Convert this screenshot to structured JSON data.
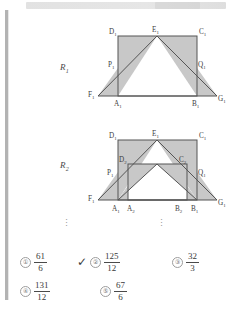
{
  "page": {
    "background": "#ffffff",
    "fill_color": "#c8c8c8",
    "stroke_color": "#555555"
  },
  "header_strip": {
    "present": true,
    "label": ""
  },
  "figures": [
    {
      "name": "R1",
      "label": "R",
      "label_sub": "1",
      "vertices": [
        "D₁",
        "E₁",
        "C₁",
        "P₁",
        "Q₁",
        "F₁",
        "A₁",
        "B₁",
        "G₁"
      ],
      "labels": {
        "D": "D",
        "D_sub": "1",
        "E": "E",
        "E_sub": "1",
        "C": "C",
        "C_sub": "1",
        "P": "P",
        "P_sub": "1",
        "Q": "Q",
        "Q_sub": "1",
        "F": "F",
        "F_sub": "1",
        "A": "A",
        "A_sub": "1",
        "B": "B",
        "B_sub": "1",
        "G": "G",
        "G_sub": "1"
      }
    },
    {
      "name": "R2",
      "label": "R",
      "label_sub": "2",
      "vertices": [
        "D₁",
        "E₁",
        "C₁",
        "D₂",
        "C₂",
        "P₁",
        "Q₁",
        "F₁",
        "A₁",
        "A₂",
        "B₂",
        "B₁",
        "G₁"
      ],
      "labels": {
        "D1": "D",
        "D1_sub": "1",
        "E1": "E",
        "E1_sub": "1",
        "C1": "C",
        "C1_sub": "1",
        "D2": "D",
        "D2_sub": "2",
        "C2": "C",
        "C2_sub": "2",
        "P1": "P",
        "P1_sub": "1",
        "Q1": "Q",
        "Q1_sub": "1",
        "F1": "F",
        "F1_sub": "1",
        "A1": "A",
        "A1_sub": "1",
        "A2": "A",
        "A2_sub": "2",
        "B2": "B",
        "B2_sub": "2",
        "B1": "B",
        "B1_sub": "1",
        "G1": "G",
        "G1_sub": "1"
      }
    }
  ],
  "ellipsis": {
    "glyph": "⋮",
    "count": 2
  },
  "answers": {
    "selected_index": 1,
    "check_glyph": "✓",
    "options": [
      {
        "number": "①",
        "numerator": "61",
        "denominator": "6",
        "selected": false
      },
      {
        "number": "②",
        "numerator": "125",
        "denominator": "12",
        "selected": true
      },
      {
        "number": "③",
        "numerator": "32",
        "denominator": "3",
        "selected": false
      },
      {
        "number": "④",
        "numerator": "131",
        "denominator": "12",
        "selected": false
      },
      {
        "number": "⑤",
        "numerator": "67",
        "denominator": "6",
        "selected": false
      }
    ]
  }
}
